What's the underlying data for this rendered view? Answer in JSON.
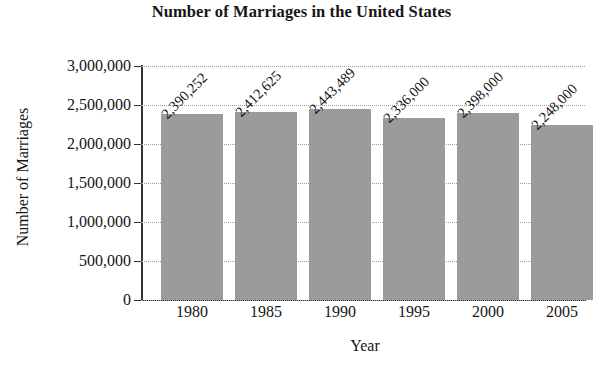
{
  "chart_data": {
    "type": "bar",
    "title": "Number of Marriages in the United States",
    "xlabel": "Year",
    "ylabel": "Number of Marriages",
    "categories": [
      "1980",
      "1985",
      "1990",
      "1995",
      "2000",
      "2005"
    ],
    "values": [
      2390252,
      2412625,
      2443489,
      2336000,
      2398000,
      2248000
    ],
    "value_labels": [
      "2,390,252",
      "2,412,625",
      "2,443,489",
      "2,336,000",
      "2,398,000",
      "2,248,000"
    ],
    "ylim": [
      0,
      3000000
    ],
    "ytick_values": [
      3000000,
      2500000,
      2000000,
      1500000,
      1000000,
      500000,
      0
    ],
    "ytick_labels": [
      "3,000,000",
      "2,500,000",
      "2,000,000",
      "1,500,000",
      "1,000,000",
      "500,000",
      "0"
    ],
    "grid": true,
    "grid_style": "dotted",
    "legend": false,
    "bar_color": "#9b9b9b",
    "axis_color": "#333333",
    "text_color": "#161616",
    "background": "#ffffff",
    "value_label_rotation": -45
  }
}
